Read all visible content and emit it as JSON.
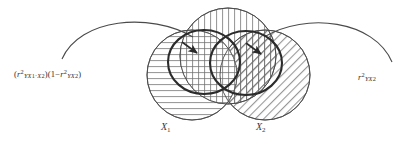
{
  "figure": {
    "background_color": "#ffffff",
    "stroke_color": "#4a4a4a",
    "bold_stroke_color": "#2b2b2b",
    "text_color": "#2f2f2f"
  },
  "annotations": {
    "left_formula": {
      "full_text": "(r² YX₁·X₂)(1−r² YX₂)",
      "open_paren": "(",
      "r": "r",
      "sup2": "2",
      "sub_a": "YX",
      "sub_a_index": "1",
      "middot": "·",
      "sub_a_index2_base": "X",
      "sub_a_index2": "2",
      "close_paren": ")",
      "second_open": "(1−",
      "second_sub": "YX",
      "second_sub_index": "2",
      "second_close": ")"
    },
    "right_formula": {
      "full_text": "r² YX₂",
      "r": "r",
      "sup2": "2",
      "sub_base": "YX",
      "sub_index": "2"
    }
  },
  "labels": {
    "x1": {
      "base": "X",
      "index": "1"
    },
    "x2": {
      "base": "X",
      "index": "2"
    }
  },
  "circles": [
    {
      "name": "circle-y",
      "label": "Y",
      "hatch": "vertical",
      "cx": 228,
      "cy": 56,
      "r": 48
    },
    {
      "name": "circle-x1",
      "label": "X1",
      "hatch": "horizontal",
      "cx": 192,
      "cy": 75,
      "r": 45
    },
    {
      "name": "circle-x2",
      "label": "X2",
      "hatch": "diagonal",
      "cx": 265,
      "cy": 75,
      "r": 45
    }
  ],
  "bold_outlines": [
    {
      "name": "bold-ellipse-left",
      "cx": 204,
      "cy": 62,
      "rx": 36,
      "ry": 32
    },
    {
      "name": "bold-ellipse-right",
      "cx": 246,
      "cy": 63,
      "rx": 36,
      "ry": 32
    }
  ],
  "arcs": [
    {
      "name": "arc-left",
      "from_x": 62,
      "from_y": 58,
      "to_x": 190,
      "to_y": 35
    },
    {
      "name": "arc-right",
      "from_x": 268,
      "from_y": 35,
      "to_x": 392,
      "to_y": 62
    }
  ],
  "arrows": [
    {
      "name": "arrow-left",
      "tip_x": 196,
      "tip_y": 51,
      "direction": "down-right"
    },
    {
      "name": "arrow-right",
      "tip_x": 259,
      "tip_y": 52,
      "direction": "down-right"
    }
  ]
}
